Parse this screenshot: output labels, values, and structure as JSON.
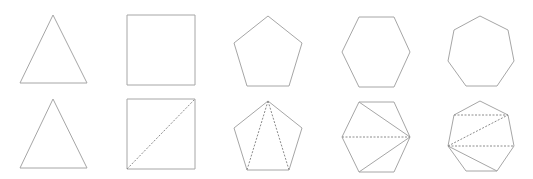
{
  "figure": {
    "colors": {
      "background": "#ffffff",
      "edge": "#a6a6a6",
      "diagonal": "#8c8c8c"
    }
  },
  "shapes": [
    {
      "name": "triangle",
      "sides": 3,
      "plain": {
        "points": [
          [
            53,
            15
          ],
          [
            87,
            83
          ],
          [
            20,
            83
          ]
        ]
      },
      "triangulated": {
        "points": [
          [
            53,
            99
          ],
          [
            87,
            168
          ],
          [
            20,
            168
          ]
        ],
        "dashed_diagonals": [],
        "solid_diagonals": []
      }
    },
    {
      "name": "square",
      "sides": 4,
      "plain": {
        "points": [
          [
            127,
            15
          ],
          [
            195,
            15
          ],
          [
            195,
            85
          ],
          [
            127,
            85
          ]
        ]
      },
      "triangulated": {
        "points": [
          [
            127,
            99
          ],
          [
            195,
            99
          ],
          [
            195,
            169
          ],
          [
            127,
            169
          ]
        ],
        "dashed_diagonals": [
          [
            [
              127,
              169
            ],
            [
              195,
              99
            ]
          ]
        ],
        "solid_diagonals": []
      }
    },
    {
      "name": "pentagon",
      "sides": 5,
      "plain": {
        "points": [
          [
            268,
            16
          ],
          [
            302,
            43
          ],
          [
            289,
            86
          ],
          [
            247,
            86
          ],
          [
            234,
            43
          ]
        ]
      },
      "triangulated": {
        "points": [
          [
            268,
            101
          ],
          [
            302,
            128
          ],
          [
            289,
            170
          ],
          [
            247,
            170
          ],
          [
            234,
            128
          ]
        ],
        "dashed_diagonals": [
          [
            [
              268,
              101
            ],
            [
              247,
              170
            ]
          ],
          [
            [
              268,
              101
            ],
            [
              289,
              170
            ]
          ]
        ],
        "solid_diagonals": []
      }
    },
    {
      "name": "hexagon",
      "sides": 6,
      "plain": {
        "points": [
          [
            359,
            17
          ],
          [
            394,
            17
          ],
          [
            410,
            52
          ],
          [
            394,
            87
          ],
          [
            359,
            87
          ],
          [
            342,
            52
          ]
        ]
      },
      "triangulated": {
        "points": [
          [
            359,
            102
          ],
          [
            394,
            102
          ],
          [
            410,
            137
          ],
          [
            394,
            172
          ],
          [
            359,
            172
          ],
          [
            342,
            137
          ]
        ],
        "dashed_diagonals": [
          [
            [
              342,
              137
            ],
            [
              410,
              137
            ]
          ]
        ],
        "solid_diagonals": [
          [
            [
              359,
              102
            ],
            [
              410,
              137
            ]
          ],
          [
            [
              359,
              172
            ],
            [
              410,
              137
            ]
          ]
        ]
      }
    },
    {
      "name": "heptagon",
      "sides": 7,
      "plain": {
        "points": [
          [
            480,
            16
          ],
          [
            508,
            30
          ],
          [
            514,
            61
          ],
          [
            497,
            86
          ],
          [
            466,
            86
          ],
          [
            448,
            61
          ],
          [
            454,
            30
          ]
        ]
      },
      "triangulated": {
        "points": [
          [
            480,
            101
          ],
          [
            508,
            115
          ],
          [
            514,
            146
          ],
          [
            497,
            171
          ],
          [
            466,
            171
          ],
          [
            448,
            146
          ],
          [
            454,
            115
          ]
        ],
        "dashed_diagonals": [
          [
            [
              454,
              115
            ],
            [
              508,
              115
            ]
          ],
          [
            [
              448,
              146
            ],
            [
              508,
              115
            ]
          ],
          [
            [
              448,
              146
            ],
            [
              514,
              146
            ]
          ]
        ],
        "solid_diagonals": [
          [
            [
              448,
              146
            ],
            [
              497,
              171
            ]
          ]
        ]
      }
    }
  ]
}
